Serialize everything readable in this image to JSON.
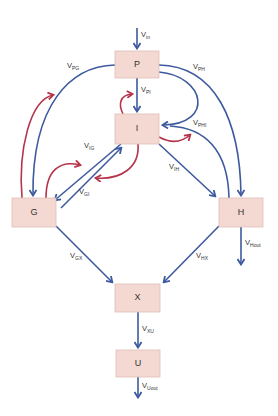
{
  "colors": {
    "node_fill": "#f3d9d2",
    "node_stroke": "#dfbfb6",
    "flow_arrow": "#3e5a9e",
    "feedback_arrow": "#b5334b",
    "text": "#333333"
  },
  "nodes": {
    "P": {
      "label": "P"
    },
    "I": {
      "label": "I"
    },
    "G": {
      "label": "G"
    },
    "H": {
      "label": "H"
    },
    "X": {
      "label": "X"
    },
    "U": {
      "label": "U"
    }
  },
  "flows": {
    "in": {
      "main": "V",
      "sub": "in"
    },
    "PI": {
      "main": "V",
      "sub": "PI"
    },
    "PG": {
      "main": "V",
      "sub": "PG"
    },
    "PH": {
      "main": "V",
      "sub": "PH"
    },
    "PHI": {
      "main": "V",
      "sub": "PHI"
    },
    "IG": {
      "main": "V",
      "sub": "IG"
    },
    "GI": {
      "main": "V",
      "sub": "GI"
    },
    "IH": {
      "main": "V",
      "sub": "IH"
    },
    "Hout": {
      "main": "V",
      "sub": "Hout"
    },
    "GX": {
      "main": "V",
      "sub": "GX"
    },
    "HX": {
      "main": "V",
      "sub": "HX"
    },
    "XU": {
      "main": "V",
      "sub": "XU"
    },
    "Uout": {
      "main": "V",
      "sub": "Uout"
    }
  }
}
